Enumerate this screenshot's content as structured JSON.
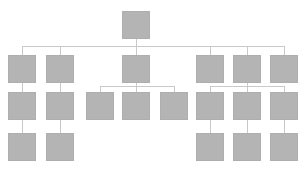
{
  "chart_data": {
    "type": "diagram",
    "diagram_kind": "organizational-tree",
    "title": "",
    "subtitle": "",
    "xlabel": "",
    "ylabel": "",
    "legend": [],
    "annotations": [],
    "grid": false,
    "canvas": {
      "width": 305,
      "height": 172,
      "background": "#ffffff"
    },
    "style": {
      "node_fill": "#b4b4b4",
      "node_stroke": "#aeaeae",
      "connector_stroke": "#c9c9c9",
      "connector_width": 1,
      "node_width": 28,
      "node_height": 28
    },
    "levels": [
      {
        "level": 1,
        "y": 11,
        "count": 1
      },
      {
        "level": 2,
        "y": 55,
        "count": 6
      },
      {
        "level": 3,
        "y": 92,
        "count": 8
      },
      {
        "level": 4,
        "y": 133,
        "count": 5
      }
    ],
    "nodes": [
      {
        "id": "n1",
        "label": "",
        "level": 1,
        "x": 122,
        "y": 11,
        "w": 28,
        "h": 28,
        "parent": null
      },
      {
        "id": "n2",
        "label": "",
        "level": 2,
        "x": 8,
        "y": 55,
        "w": 28,
        "h": 28,
        "parent": "n1"
      },
      {
        "id": "n3",
        "label": "",
        "level": 2,
        "x": 46,
        "y": 55,
        "w": 28,
        "h": 28,
        "parent": "n1"
      },
      {
        "id": "n4",
        "label": "",
        "level": 2,
        "x": 122,
        "y": 55,
        "w": 28,
        "h": 28,
        "parent": "n1"
      },
      {
        "id": "n5",
        "label": "",
        "level": 2,
        "x": 196,
        "y": 55,
        "w": 28,
        "h": 28,
        "parent": "n1"
      },
      {
        "id": "n6",
        "label": "",
        "level": 2,
        "x": 233,
        "y": 55,
        "w": 28,
        "h": 28,
        "parent": "n1"
      },
      {
        "id": "n7",
        "label": "",
        "level": 2,
        "x": 270,
        "y": 55,
        "w": 28,
        "h": 28,
        "parent": "n1"
      },
      {
        "id": "n8",
        "label": "",
        "level": 3,
        "x": 8,
        "y": 92,
        "w": 28,
        "h": 28,
        "parent": "n2"
      },
      {
        "id": "n9",
        "label": "",
        "level": 3,
        "x": 46,
        "y": 92,
        "w": 28,
        "h": 28,
        "parent": "n3"
      },
      {
        "id": "n10",
        "label": "",
        "level": 3,
        "x": 86,
        "y": 92,
        "w": 28,
        "h": 28,
        "parent": "n4"
      },
      {
        "id": "n11",
        "label": "",
        "level": 3,
        "x": 122,
        "y": 92,
        "w": 28,
        "h": 28,
        "parent": "n4"
      },
      {
        "id": "n12",
        "label": "",
        "level": 3,
        "x": 160,
        "y": 92,
        "w": 28,
        "h": 28,
        "parent": "n4"
      },
      {
        "id": "n13",
        "label": "",
        "level": 3,
        "x": 196,
        "y": 92,
        "w": 28,
        "h": 28,
        "parent": "n6"
      },
      {
        "id": "n14",
        "label": "",
        "level": 3,
        "x": 233,
        "y": 92,
        "w": 28,
        "h": 28,
        "parent": "n6"
      },
      {
        "id": "n15",
        "label": "",
        "level": 3,
        "x": 270,
        "y": 92,
        "w": 28,
        "h": 28,
        "parent": "n6"
      },
      {
        "id": "n16",
        "label": "",
        "level": 4,
        "x": 8,
        "y": 133,
        "w": 28,
        "h": 28,
        "parent": "n8"
      },
      {
        "id": "n17",
        "label": "",
        "level": 4,
        "x": 46,
        "y": 133,
        "w": 28,
        "h": 28,
        "parent": "n9"
      },
      {
        "id": "n18",
        "label": "",
        "level": 4,
        "x": 196,
        "y": 133,
        "w": 28,
        "h": 28,
        "parent": "n13"
      },
      {
        "id": "n19",
        "label": "",
        "level": 4,
        "x": 233,
        "y": 133,
        "w": 28,
        "h": 28,
        "parent": "n14"
      },
      {
        "id": "n20",
        "label": "",
        "level": 4,
        "x": 270,
        "y": 133,
        "w": 28,
        "h": 28,
        "parent": "n15"
      }
    ],
    "connectors": [
      {
        "id": "c-root-stub",
        "kind": "vline",
        "x": 136,
        "y1": 39,
        "y2": 46
      },
      {
        "id": "c-root-bus",
        "kind": "hline",
        "y": 46,
        "x1": 22,
        "x2": 284
      },
      {
        "id": "c-root-n2",
        "kind": "vline",
        "x": 22,
        "y1": 46,
        "y2": 55
      },
      {
        "id": "c-root-n3",
        "kind": "vline",
        "x": 60,
        "y1": 46,
        "y2": 55
      },
      {
        "id": "c-root-n4",
        "kind": "vline",
        "x": 136,
        "y1": 46,
        "y2": 55
      },
      {
        "id": "c-root-n5",
        "kind": "vline",
        "x": 210,
        "y1": 46,
        "y2": 55
      },
      {
        "id": "c-root-n6",
        "kind": "vline",
        "x": 247,
        "y1": 46,
        "y2": 55
      },
      {
        "id": "c-root-n7",
        "kind": "vline",
        "x": 284,
        "y1": 46,
        "y2": 55
      },
      {
        "id": "c-n2-n8",
        "kind": "vline",
        "x": 22,
        "y1": 83,
        "y2": 92
      },
      {
        "id": "c-n3-n9",
        "kind": "vline",
        "x": 60,
        "y1": 83,
        "y2": 92
      },
      {
        "id": "c-n4-stub",
        "kind": "vline",
        "x": 136,
        "y1": 83,
        "y2": 86
      },
      {
        "id": "c-n4-bus",
        "kind": "hline",
        "y": 86,
        "x1": 100,
        "x2": 174
      },
      {
        "id": "c-n4-n10",
        "kind": "vline",
        "x": 100,
        "y1": 86,
        "y2": 92
      },
      {
        "id": "c-n4-n11",
        "kind": "vline",
        "x": 136,
        "y1": 86,
        "y2": 92
      },
      {
        "id": "c-n4-n12",
        "kind": "vline",
        "x": 174,
        "y1": 86,
        "y2": 92
      },
      {
        "id": "c-n6-stub",
        "kind": "vline",
        "x": 247,
        "y1": 83,
        "y2": 86
      },
      {
        "id": "c-n6-bus",
        "kind": "hline",
        "y": 86,
        "x1": 210,
        "x2": 284
      },
      {
        "id": "c-n6-n13",
        "kind": "vline",
        "x": 210,
        "y1": 86,
        "y2": 92
      },
      {
        "id": "c-n6-n14",
        "kind": "vline",
        "x": 247,
        "y1": 86,
        "y2": 92
      },
      {
        "id": "c-n6-n15",
        "kind": "vline",
        "x": 284,
        "y1": 86,
        "y2": 92
      },
      {
        "id": "c-n8-n16",
        "kind": "vline",
        "x": 22,
        "y1": 120,
        "y2": 133
      },
      {
        "id": "c-n9-n17",
        "kind": "vline",
        "x": 60,
        "y1": 120,
        "y2": 133
      },
      {
        "id": "c-n13-n18",
        "kind": "vline",
        "x": 210,
        "y1": 120,
        "y2": 133
      },
      {
        "id": "c-n14-n19",
        "kind": "vline",
        "x": 247,
        "y1": 120,
        "y2": 133
      },
      {
        "id": "c-n15-n20",
        "kind": "vline",
        "x": 284,
        "y1": 120,
        "y2": 133
      }
    ]
  }
}
